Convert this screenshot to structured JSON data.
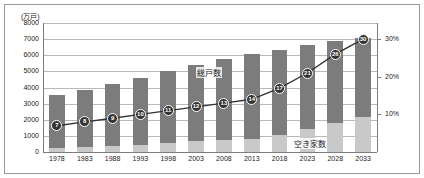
{
  "chart_data": {
    "type": "bar",
    "title": "",
    "unit_caption": "(万戸)",
    "xlabel": "",
    "ylabel": "",
    "ylim": [
      0,
      8000
    ],
    "y2lim": [
      0,
      34.3
    ],
    "grid": true,
    "legend_position": "inline-annotation",
    "categories": [
      "1978",
      "1983",
      "1988",
      "1993",
      "1998",
      "2003",
      "2008",
      "2013",
      "2018",
      "2023",
      "2028",
      "2033"
    ],
    "yticks": [
      "8000",
      "7000",
      "6000",
      "5000",
      "4000",
      "3000",
      "2000",
      "1000",
      "0"
    ],
    "ytick_values": [
      8000,
      7000,
      6000,
      5000,
      4000,
      3000,
      2000,
      1000,
      0
    ],
    "y2ticks": [
      "30%",
      "20%",
      "10%"
    ],
    "y2tick_values": [
      30,
      20,
      10
    ],
    "series": [
      {
        "name": "総戸数",
        "type": "bar",
        "color": "#7c7c7c",
        "axis": "left",
        "values": [
          3550,
          3870,
          4200,
          4590,
          5030,
          5390,
          5760,
          6060,
          6340,
          6650,
          6870,
          7070
        ]
      },
      {
        "name": "空き家数",
        "type": "bar",
        "color": "#c9c9c9",
        "axis": "left",
        "values": [
          270,
          330,
          400,
          450,
          580,
          660,
          760,
          820,
          1080,
          1400,
          1790,
          2150
        ]
      },
      {
        "name": "空き家率",
        "type": "line",
        "color": "#333333",
        "axis": "right",
        "values": [
          7,
          8,
          9,
          10,
          11,
          12,
          13,
          14,
          17,
          21,
          26,
          30
        ],
        "marker_labels": [
          "7",
          "8",
          "9",
          "10",
          "11",
          "12",
          "13",
          "14",
          "17",
          "21",
          "26",
          "30"
        ]
      }
    ],
    "annotations": [
      {
        "text": "総戸数",
        "x_frac": 0.505,
        "y_px": 62
      },
      {
        "text": "空き家数",
        "x_frac": 0.795,
        "y_px": 133
      }
    ]
  }
}
